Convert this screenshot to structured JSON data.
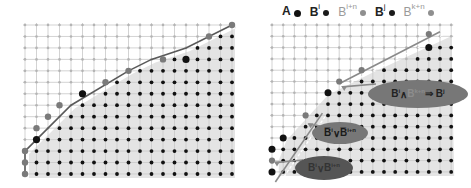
{
  "legend": {
    "items": [
      {
        "key": "A",
        "sup": "",
        "faded": false,
        "dot_color": "#111111",
        "dot_size": 7
      },
      {
        "key": "B",
        "sup": "i",
        "faded": false,
        "dot_color": "#1a1a1a",
        "dot_size": 6
      },
      {
        "key": "B",
        "sup": "i+n",
        "faded": true,
        "dot_color": "#8f8f8f",
        "dot_size": 6
      },
      {
        "key": "B",
        "sup": "j",
        "faded": false,
        "dot_color": "#1a1a1a",
        "dot_size": 6
      },
      {
        "key": "B",
        "sup": "k+n",
        "faded": true,
        "dot_color": "#8f8f8f",
        "dot_size": 6
      }
    ]
  },
  "colors": {
    "grid_line": "#c8c8c8",
    "grid_dot_light": "#b4b4b4",
    "region_fill": "#e4e4e4",
    "interior_dot": "#111111",
    "boundary_line": "#5a5a5a",
    "boundary_dot_gray": "#7a7a7a",
    "vertex_dot": "#111111",
    "ellipse_dark": "#666666",
    "ellipse_mid": "#888888"
  },
  "left_panel": {
    "grid": {
      "x0": 25,
      "y0": 25,
      "dx": 11.5,
      "dy": 11.46,
      "cols": 19,
      "rows": 14
    },
    "boundary_vertices": [
      [
        0,
        13
      ],
      [
        0,
        11
      ],
      [
        1,
        10
      ],
      [
        4,
        7
      ],
      [
        9,
        4
      ],
      [
        11,
        3
      ],
      [
        14,
        2
      ],
      [
        18,
        0
      ]
    ],
    "gray_boundary_dots": [
      [
        0,
        13
      ],
      [
        0,
        12
      ],
      [
        0,
        11
      ],
      [
        1,
        9
      ],
      [
        2,
        8
      ],
      [
        3,
        7
      ],
      [
        5,
        6
      ],
      [
        7,
        5
      ],
      [
        9,
        4
      ],
      [
        12,
        3
      ],
      [
        16,
        1
      ],
      [
        18,
        0
      ]
    ],
    "vertex_dots": [
      [
        1,
        10
      ],
      [
        5,
        6
      ],
      [
        14,
        3
      ]
    ]
  },
  "right_panel": {
    "grid": {
      "x0": 272,
      "y0": 25,
      "dx": 11.2,
      "dy": 11.3,
      "cols": 17,
      "rows": 14
    },
    "dashed_segments": [
      [
        [
          0.3,
          13.9
        ],
        [
          4.5,
          7.8
        ]
      ],
      [
        [
          6,
          5.2
        ],
        [
          15,
          0.6
        ]
      ]
    ],
    "gray_boundary_dots": [
      [
        0,
        12
      ],
      [
        3,
        8
      ],
      [
        6,
        5
      ],
      [
        8,
        4
      ],
      [
        14,
        0.8
      ]
    ],
    "vertex_dots": [
      [
        0,
        13
      ],
      [
        0,
        11
      ],
      [
        1,
        10
      ],
      [
        5,
        6
      ],
      [
        14,
        2
      ]
    ],
    "annotations": [
      {
        "id": "and-implies",
        "parts": [
          {
            "t": "B",
            "sup": "i",
            "dim": false
          },
          {
            "t": " ∧ ",
            "sup": "",
            "dim": false
          },
          {
            "t": "B",
            "sup": "k+n",
            "dim": true
          },
          {
            "t": " ⇒ B",
            "sup": "j",
            "dim": false
          }
        ],
        "cx": 418,
        "cy": 94,
        "w": 100,
        "h": 28,
        "fill": "#777777",
        "color": "#222222",
        "arrow_to": [
          6,
          5.3
        ]
      },
      {
        "id": "not-or-not",
        "parts": [
          {
            "t": "B̅",
            "sup": "i",
            "dim": false
          },
          {
            "t": "∨",
            "sup": "",
            "dim": false
          },
          {
            "t": "B̅",
            "sup": "i+n",
            "dim": false
          }
        ],
        "cx": 340,
        "cy": 133,
        "w": 56,
        "h": 22,
        "fill": "#777777",
        "color": "#1a1a1a",
        "arrow_to": [
          3,
          8.6
        ]
      },
      {
        "id": "or",
        "parts": [
          {
            "t": "B",
            "sup": "i",
            "dim": false
          },
          {
            "t": "∨",
            "sup": "",
            "dim": false
          },
          {
            "t": "B",
            "sup": "i+n",
            "dim": false
          }
        ],
        "cx": 324,
        "cy": 168,
        "w": 58,
        "h": 24,
        "fill": "#555555",
        "color": "#333333",
        "arrow_to": [
          0,
          12
        ]
      }
    ]
  }
}
